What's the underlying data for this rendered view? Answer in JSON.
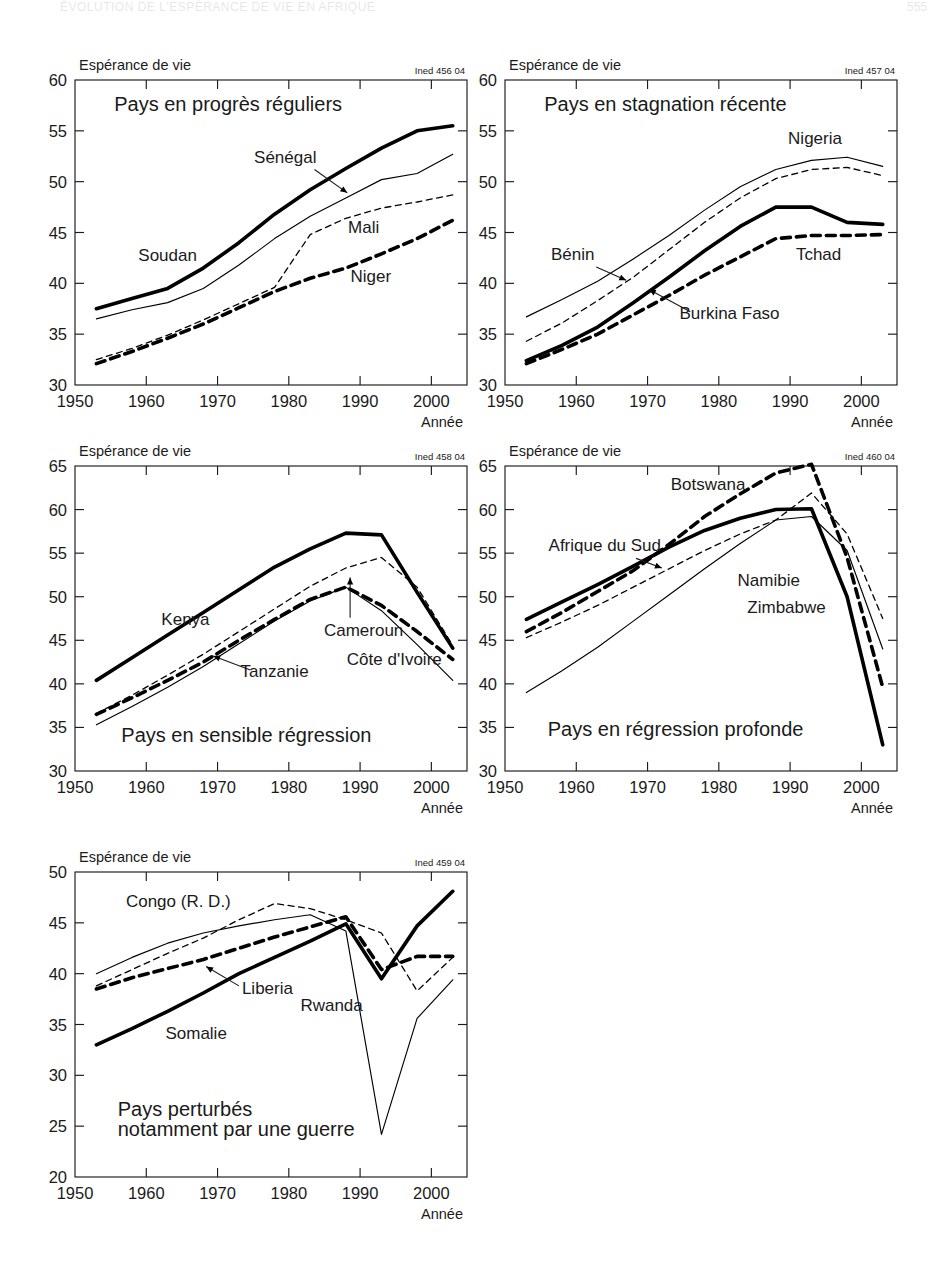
{
  "page_header": {
    "title": "ÉVOLUTION DE L'ESPÉRANCE DE VIE EN AFRIQUE",
    "page_number": "555"
  },
  "common": {
    "y_axis_title": "Espérance de vie",
    "x_axis_title": "Année",
    "x_ticks": [
      "1950",
      "1960",
      "1970",
      "1980",
      "1990",
      "2000"
    ]
  },
  "chart_data": [
    {
      "id": "chart-1",
      "type": "line",
      "title": "Pays en progrès réguliers",
      "source_code": "Ined 456 04",
      "xlabel": "Année",
      "ylabel": "Espérance de vie",
      "xlim": [
        1950,
        2005
      ],
      "ylim": [
        30,
        60
      ],
      "x_ticks": [
        "1950",
        "1960",
        "1970",
        "1980",
        "1990",
        "2000"
      ],
      "y_ticks": [
        "30",
        "35",
        "40",
        "45",
        "50",
        "55",
        "60"
      ],
      "grid": false,
      "legend": "inline-labels",
      "x": [
        1953,
        1958,
        1963,
        1968,
        1973,
        1978,
        1983,
        1988,
        1993,
        1998,
        2003
      ],
      "series": [
        {
          "name": "Soudan",
          "style": "thick-solid",
          "values": [
            37.5,
            38.5,
            39.5,
            41.5,
            44.0,
            46.8,
            49.2,
            51.3,
            53.3,
            55.0,
            55.5
          ]
        },
        {
          "name": "Sénégal",
          "style": "thin-solid",
          "values": [
            36.5,
            37.4,
            38.1,
            39.5,
            41.8,
            44.4,
            46.6,
            48.4,
            50.2,
            50.8,
            52.7
          ]
        },
        {
          "name": "Mali",
          "style": "thin-dashed",
          "values": [
            32.5,
            33.6,
            34.9,
            36.4,
            38.0,
            39.6,
            44.8,
            46.4,
            47.4,
            48.0,
            48.7
          ]
        },
        {
          "name": "Niger",
          "style": "thick-dashed",
          "values": [
            32.1,
            33.3,
            34.6,
            36.0,
            37.6,
            39.2,
            40.5,
            41.5,
            42.9,
            44.4,
            46.2
          ]
        }
      ],
      "annotations": [
        {
          "label": "Soudan",
          "anchor": "left-mid"
        },
        {
          "label": "Sénégal",
          "anchor": "arrow-to-thin-solid"
        },
        {
          "label": "Mali",
          "anchor": "right-mid"
        },
        {
          "label": "Niger",
          "anchor": "right-low"
        }
      ]
    },
    {
      "id": "chart-2",
      "type": "line",
      "title": "Pays en stagnation récente",
      "source_code": "Ined 457 04",
      "xlabel": "Année",
      "ylabel": "Espérance de vie",
      "xlim": [
        1950,
        2005
      ],
      "ylim": [
        30,
        60
      ],
      "x_ticks": [
        "1950",
        "1960",
        "1970",
        "1980",
        "1990",
        "2000"
      ],
      "y_ticks": [
        "30",
        "35",
        "40",
        "45",
        "50",
        "55",
        "60"
      ],
      "grid": false,
      "legend": "inline-labels",
      "x": [
        1953,
        1958,
        1963,
        1968,
        1973,
        1978,
        1983,
        1988,
        1993,
        1998,
        2003
      ],
      "series": [
        {
          "name": "Nigeria",
          "style": "thin-solid",
          "values": [
            36.7,
            38.4,
            40.2,
            42.4,
            44.7,
            47.2,
            49.5,
            51.2,
            52.1,
            52.4,
            51.5
          ]
        },
        {
          "name": "Bénin",
          "style": "thin-dashed",
          "values": [
            34.3,
            36.1,
            38.3,
            40.6,
            43.3,
            46.0,
            48.4,
            50.3,
            51.2,
            51.4,
            50.6
          ]
        },
        {
          "name": "Burkina Faso",
          "style": "thick-solid",
          "values": [
            32.4,
            33.9,
            35.7,
            38.1,
            40.6,
            43.2,
            45.6,
            47.5,
            47.5,
            46.0,
            45.8
          ]
        },
        {
          "name": "Tchad",
          "style": "thick-dashed",
          "values": [
            32.1,
            33.5,
            35.0,
            36.9,
            38.8,
            40.8,
            42.6,
            44.4,
            44.7,
            44.7,
            44.8
          ]
        }
      ],
      "annotations": [
        {
          "label": "Nigeria",
          "anchor": "top-right"
        },
        {
          "label": "Bénin",
          "anchor": "arrow-to-thin-dashed"
        },
        {
          "label": "Burkina Faso",
          "anchor": "arrow-to-thick-solid"
        },
        {
          "label": "Tchad",
          "anchor": "right-mid"
        }
      ]
    },
    {
      "id": "chart-3",
      "type": "line",
      "title": "Pays en sensible régression",
      "source_code": "Ined 458 04",
      "xlabel": "Année",
      "ylabel": "Espérance de vie",
      "xlim": [
        1950,
        2005
      ],
      "ylim": [
        30,
        65
      ],
      "x_ticks": [
        "1950",
        "1960",
        "1970",
        "1980",
        "1990",
        "2000"
      ],
      "y_ticks": [
        "30",
        "35",
        "40",
        "45",
        "50",
        "55",
        "60",
        "65"
      ],
      "grid": false,
      "legend": "inline-labels",
      "x": [
        1953,
        1958,
        1963,
        1968,
        1973,
        1978,
        1983,
        1988,
        1993,
        1998,
        2003
      ],
      "series": [
        {
          "name": "Kenya",
          "style": "thick-solid",
          "values": [
            40.4,
            43.0,
            45.6,
            48.2,
            50.8,
            53.4,
            55.5,
            57.3,
            57.1,
            50.5,
            44.1
          ]
        },
        {
          "name": "Cameroun",
          "style": "thin-dashed",
          "values": [
            36.6,
            38.7,
            41.0,
            43.4,
            46.0,
            48.6,
            51.2,
            53.3,
            54.5,
            51.1,
            44.4
          ]
        },
        {
          "name": "Tanzanie",
          "style": "thick-dashed",
          "values": [
            36.5,
            38.4,
            40.4,
            42.5,
            45.0,
            47.4,
            49.7,
            51.1,
            49.0,
            46.0,
            42.8
          ]
        },
        {
          "name": "Côte d'Ivoire",
          "style": "thin-solid",
          "values": [
            35.3,
            37.4,
            39.6,
            42.0,
            44.6,
            47.2,
            49.5,
            51.1,
            48.4,
            44.5,
            40.4
          ]
        }
      ],
      "annotations": [
        {
          "label": "Kenya",
          "anchor": "left-mid"
        },
        {
          "label": "Cameroun",
          "anchor": "arrow-up-to-thin-dashed"
        },
        {
          "label": "Tanzanie",
          "anchor": "arrow-to-thick-dashed"
        },
        {
          "label": "Côte d'Ivoire",
          "anchor": "right-low"
        }
      ]
    },
    {
      "id": "chart-4",
      "type": "line",
      "title": "Pays en régression profonde",
      "source_code": "Ined 460 04",
      "xlabel": "Année",
      "ylabel": "Espérance de vie",
      "xlim": [
        1950,
        2005
      ],
      "ylim": [
        30,
        65
      ],
      "x_ticks": [
        "1950",
        "1960",
        "1970",
        "1980",
        "1990",
        "2000"
      ],
      "y_ticks": [
        "30",
        "35",
        "40",
        "45",
        "50",
        "55",
        "60",
        "65"
      ],
      "grid": false,
      "legend": "inline-labels",
      "x": [
        1953,
        1958,
        1963,
        1968,
        1973,
        1978,
        1983,
        1988,
        1993,
        1998,
        2003
      ],
      "series": [
        {
          "name": "Botswana",
          "style": "thick-dashed",
          "values": [
            46.0,
            48.2,
            50.6,
            53.0,
            56.0,
            59.2,
            61.8,
            64.2,
            65.2,
            54.5,
            39.6
          ]
        },
        {
          "name": "Afrique du Sud",
          "style": "thick-solid",
          "values": [
            47.4,
            49.4,
            51.4,
            53.5,
            55.7,
            57.6,
            59.0,
            60.0,
            60.1,
            50.0,
            33.0
          ]
        },
        {
          "name": "Namibie",
          "style": "thin-dashed",
          "values": [
            45.3,
            47.1,
            49.0,
            51.1,
            53.2,
            55.3,
            57.2,
            58.8,
            61.9,
            57.2,
            47.5
          ]
        },
        {
          "name": "Zimbabwe",
          "style": "thin-solid",
          "values": [
            39.0,
            41.5,
            44.2,
            47.2,
            50.2,
            53.2,
            56.1,
            58.8,
            59.2,
            55.3,
            44.0
          ]
        }
      ],
      "annotations": [
        {
          "label": "Botswana",
          "anchor": "top-center"
        },
        {
          "label": "Afrique du Sud",
          "anchor": "arrow-to-thick-solid"
        },
        {
          "label": "Namibie",
          "anchor": "mid-right"
        },
        {
          "label": "Zimbabwe",
          "anchor": "mid-right-low"
        }
      ]
    },
    {
      "id": "chart-5",
      "type": "line",
      "title": "Pays perturbés\nnotamment par une guerre",
      "title_line1": "Pays perturbés",
      "title_line2": "notamment par une guerre",
      "source_code": "Ined 459 04",
      "xlabel": "Année",
      "ylabel": "Espérance de vie",
      "xlim": [
        1950,
        2005
      ],
      "ylim": [
        20,
        50
      ],
      "x_ticks": [
        "1950",
        "1960",
        "1970",
        "1980",
        "1990",
        "2000"
      ],
      "y_ticks": [
        "20",
        "25",
        "30",
        "35",
        "40",
        "45",
        "50"
      ],
      "grid": false,
      "legend": "inline-labels",
      "x": [
        1953,
        1958,
        1963,
        1968,
        1973,
        1978,
        1983,
        1988,
        1993,
        1998,
        2003
      ],
      "series": [
        {
          "name": "Congo (R. D.)",
          "style": "thin-dashed",
          "values": [
            38.8,
            40.4,
            42.0,
            43.5,
            45.3,
            46.9,
            46.4,
            45.3,
            44.0,
            38.3,
            41.6
          ]
        },
        {
          "name": "Rwanda",
          "style": "thin-solid",
          "values": [
            40.0,
            41.6,
            43.0,
            44.0,
            44.7,
            45.3,
            45.8,
            44.2,
            24.2,
            35.6,
            39.4
          ]
        },
        {
          "name": "Liberia",
          "style": "thick-dashed",
          "values": [
            38.5,
            39.6,
            40.5,
            41.4,
            42.5,
            43.6,
            44.6,
            45.6,
            40.4,
            41.7,
            41.7
          ]
        },
        {
          "name": "Somalie",
          "style": "thick-solid",
          "values": [
            33.0,
            34.6,
            36.3,
            38.1,
            40.0,
            41.6,
            43.2,
            44.9,
            39.5,
            44.7,
            48.1
          ]
        }
      ],
      "annotations": [
        {
          "label": "Congo (R. D.)",
          "anchor": "top-left"
        },
        {
          "label": "Liberia",
          "anchor": "arrow-to-thick-dashed"
        },
        {
          "label": "Rwanda",
          "anchor": "mid-center"
        },
        {
          "label": "Somalie",
          "anchor": "left-low"
        }
      ]
    }
  ]
}
